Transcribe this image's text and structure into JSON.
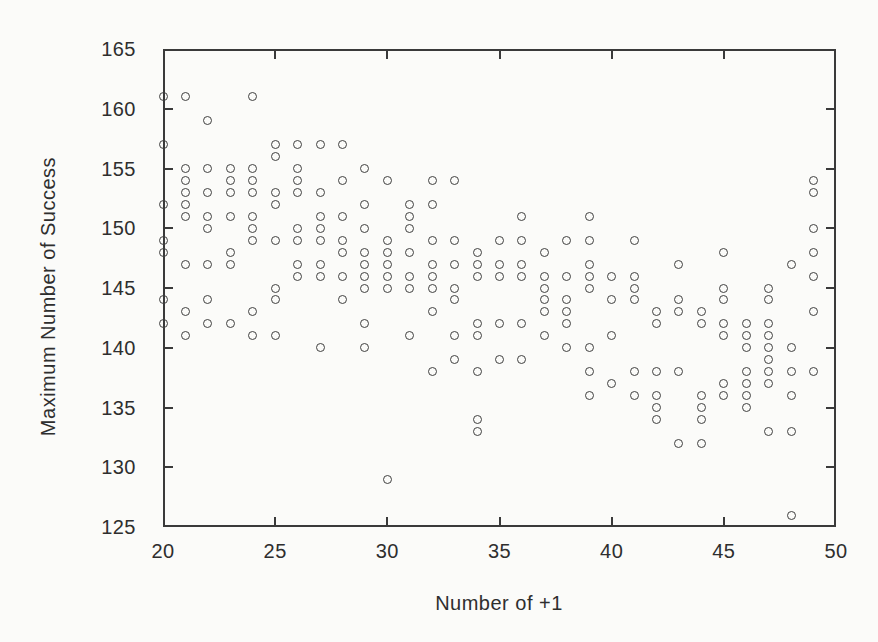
{
  "chart_data": {
    "type": "scatter",
    "title": "",
    "xlabel": "Number of +1",
    "ylabel": "Maximum Number of Success",
    "xlim": [
      20,
      50
    ],
    "ylim": [
      125,
      165
    ],
    "x_ticks": [
      20,
      25,
      30,
      35,
      40,
      45,
      50
    ],
    "y_ticks": [
      125,
      130,
      135,
      140,
      145,
      150,
      155,
      160,
      165
    ],
    "grid": false,
    "legend": "none",
    "marker": "open-circle",
    "marker_color": "#404040",
    "points": [
      [
        20,
        161
      ],
      [
        20,
        157
      ],
      [
        20,
        152
      ],
      [
        20,
        149
      ],
      [
        20,
        148
      ],
      [
        20,
        144
      ],
      [
        20,
        142
      ],
      [
        21,
        161
      ],
      [
        21,
        155
      ],
      [
        21,
        154
      ],
      [
        21,
        153
      ],
      [
        21,
        152
      ],
      [
        21,
        151
      ],
      [
        21,
        147
      ],
      [
        21,
        143
      ],
      [
        21,
        141
      ],
      [
        22,
        159
      ],
      [
        22,
        155
      ],
      [
        22,
        153
      ],
      [
        22,
        151
      ],
      [
        22,
        150
      ],
      [
        22,
        147
      ],
      [
        22,
        144
      ],
      [
        22,
        142
      ],
      [
        23,
        155
      ],
      [
        23,
        154
      ],
      [
        23,
        153
      ],
      [
        23,
        151
      ],
      [
        23,
        148
      ],
      [
        23,
        147
      ],
      [
        23,
        142
      ],
      [
        24,
        161
      ],
      [
        24,
        155
      ],
      [
        24,
        154
      ],
      [
        24,
        153
      ],
      [
        24,
        151
      ],
      [
        24,
        150
      ],
      [
        24,
        149
      ],
      [
        24,
        143
      ],
      [
        24,
        141
      ],
      [
        25,
        157
      ],
      [
        25,
        156
      ],
      [
        25,
        153
      ],
      [
        25,
        152
      ],
      [
        25,
        149
      ],
      [
        25,
        145
      ],
      [
        25,
        144
      ],
      [
        25,
        141
      ],
      [
        26,
        157
      ],
      [
        26,
        155
      ],
      [
        26,
        154
      ],
      [
        26,
        153
      ],
      [
        26,
        150
      ],
      [
        26,
        149
      ],
      [
        26,
        147
      ],
      [
        26,
        146
      ],
      [
        27,
        157
      ],
      [
        27,
        153
      ],
      [
        27,
        151
      ],
      [
        27,
        150
      ],
      [
        27,
        149
      ],
      [
        27,
        147
      ],
      [
        27,
        146
      ],
      [
        27,
        140
      ],
      [
        28,
        157
      ],
      [
        28,
        154
      ],
      [
        28,
        151
      ],
      [
        28,
        149
      ],
      [
        28,
        148
      ],
      [
        28,
        146
      ],
      [
        28,
        144
      ],
      [
        29,
        155
      ],
      [
        29,
        152
      ],
      [
        29,
        150
      ],
      [
        29,
        148
      ],
      [
        29,
        147
      ],
      [
        29,
        146
      ],
      [
        29,
        145
      ],
      [
        29,
        142
      ],
      [
        29,
        140
      ],
      [
        30,
        154
      ],
      [
        30,
        149
      ],
      [
        30,
        148
      ],
      [
        30,
        147
      ],
      [
        30,
        146
      ],
      [
        30,
        145
      ],
      [
        30,
        129
      ],
      [
        31,
        152
      ],
      [
        31,
        151
      ],
      [
        31,
        150
      ],
      [
        31,
        148
      ],
      [
        31,
        146
      ],
      [
        31,
        145
      ],
      [
        31,
        141
      ],
      [
        32,
        154
      ],
      [
        32,
        152
      ],
      [
        32,
        149
      ],
      [
        32,
        147
      ],
      [
        32,
        146
      ],
      [
        32,
        145
      ],
      [
        32,
        143
      ],
      [
        32,
        138
      ],
      [
        33,
        154
      ],
      [
        33,
        149
      ],
      [
        33,
        147
      ],
      [
        33,
        145
      ],
      [
        33,
        144
      ],
      [
        33,
        141
      ],
      [
        33,
        139
      ],
      [
        34,
        148
      ],
      [
        34,
        147
      ],
      [
        34,
        146
      ],
      [
        34,
        142
      ],
      [
        34,
        141
      ],
      [
        34,
        138
      ],
      [
        34,
        134
      ],
      [
        34,
        133
      ],
      [
        35,
        149
      ],
      [
        35,
        147
      ],
      [
        35,
        146
      ],
      [
        35,
        142
      ],
      [
        35,
        139
      ],
      [
        36,
        151
      ],
      [
        36,
        149
      ],
      [
        36,
        147
      ],
      [
        36,
        146
      ],
      [
        36,
        142
      ],
      [
        36,
        139
      ],
      [
        37,
        148
      ],
      [
        37,
        146
      ],
      [
        37,
        145
      ],
      [
        37,
        144
      ],
      [
        37,
        143
      ],
      [
        37,
        141
      ],
      [
        38,
        149
      ],
      [
        38,
        146
      ],
      [
        38,
        144
      ],
      [
        38,
        143
      ],
      [
        38,
        142
      ],
      [
        38,
        140
      ],
      [
        39,
        151
      ],
      [
        39,
        149
      ],
      [
        39,
        147
      ],
      [
        39,
        146
      ],
      [
        39,
        145
      ],
      [
        39,
        140
      ],
      [
        39,
        138
      ],
      [
        39,
        136
      ],
      [
        40,
        146
      ],
      [
        40,
        144
      ],
      [
        40,
        141
      ],
      [
        40,
        137
      ],
      [
        41,
        149
      ],
      [
        41,
        146
      ],
      [
        41,
        145
      ],
      [
        41,
        144
      ],
      [
        41,
        138
      ],
      [
        41,
        136
      ],
      [
        42,
        143
      ],
      [
        42,
        142
      ],
      [
        42,
        138
      ],
      [
        42,
        136
      ],
      [
        42,
        135
      ],
      [
        42,
        134
      ],
      [
        43,
        147
      ],
      [
        43,
        144
      ],
      [
        43,
        143
      ],
      [
        43,
        138
      ],
      [
        43,
        132
      ],
      [
        44,
        143
      ],
      [
        44,
        142
      ],
      [
        44,
        136
      ],
      [
        44,
        135
      ],
      [
        44,
        134
      ],
      [
        44,
        132
      ],
      [
        45,
        148
      ],
      [
        45,
        145
      ],
      [
        45,
        144
      ],
      [
        45,
        142
      ],
      [
        45,
        141
      ],
      [
        45,
        137
      ],
      [
        45,
        136
      ],
      [
        46,
        142
      ],
      [
        46,
        141
      ],
      [
        46,
        140
      ],
      [
        46,
        138
      ],
      [
        46,
        137
      ],
      [
        46,
        136
      ],
      [
        46,
        135
      ],
      [
        47,
        145
      ],
      [
        47,
        144
      ],
      [
        47,
        142
      ],
      [
        47,
        141
      ],
      [
        47,
        140
      ],
      [
        47,
        139
      ],
      [
        47,
        138
      ],
      [
        47,
        137
      ],
      [
        47,
        133
      ],
      [
        48,
        147
      ],
      [
        48,
        140
      ],
      [
        48,
        138
      ],
      [
        48,
        136
      ],
      [
        48,
        133
      ],
      [
        48,
        126
      ],
      [
        49,
        154
      ],
      [
        49,
        153
      ],
      [
        49,
        150
      ],
      [
        49,
        148
      ],
      [
        49,
        146
      ],
      [
        49,
        143
      ],
      [
        49,
        138
      ]
    ]
  }
}
